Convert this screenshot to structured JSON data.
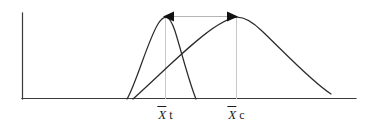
{
  "figure": {
    "background_color": "#ffffff",
    "axis_color": "#3a3a3a",
    "curve_color": "#2b2b2b",
    "dropline_color": "#c9c9c9",
    "arrow_color": "#111111",
    "origin_x": 22,
    "origin_y": 99,
    "y_axis_top": 13,
    "x_axis_right": 356,
    "labels": [
      {
        "id": "treatment-mean",
        "symbol": "X",
        "subscript": "t",
        "text": "X̄ t",
        "x": 165,
        "y": 108
      },
      {
        "id": "control-mean",
        "symbol": "X",
        "subscript": "c",
        "text": "X̄ c",
        "x": 236,
        "y": 108
      }
    ],
    "curves": [
      {
        "id": "treatment-curve",
        "name": "narrow-tall-distribution",
        "peak_x": 165,
        "peak_y": 17,
        "left_foot_x": 127,
        "right_foot_x": 196,
        "baseline_y": 99,
        "path": "M 127 99 C 136 84 148 40 158 24 C 161 19 164 17 166 17 C 169 17 172 22 175 31 C 181 50 189 82 196 99"
      },
      {
        "id": "control-curve",
        "name": "wide-flat-distribution",
        "peak_x": 236,
        "peak_y": 16,
        "left_foot_x": 133,
        "right_foot_x": 331,
        "baseline_y": 99,
        "path": "M 133 99 C 160 75 196 38 218 25 C 226 20 232 17 237 17 C 244 17 252 21 262 31 C 283 51 312 82 331 94"
      }
    ],
    "droplines": [
      {
        "id": "treatment-dropline",
        "x": 165,
        "y_top": 17,
        "y_bottom": 99
      },
      {
        "id": "control-dropline",
        "x": 236,
        "y_top": 17,
        "y_bottom": 99
      }
    ],
    "difference_arrow": {
      "id": "mean-difference-arrow",
      "y": 16,
      "x_left": 165,
      "x_right": 236,
      "double_headed": true,
      "head_length": 11,
      "head_half_width": 5
    }
  }
}
